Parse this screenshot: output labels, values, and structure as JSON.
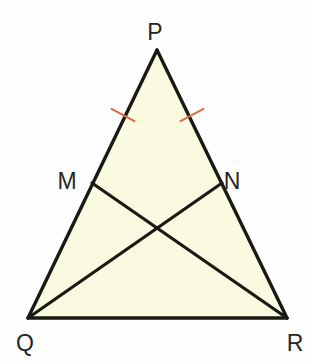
{
  "figure": {
    "canvas": {
      "width": 313,
      "height": 364,
      "background": "#fefefe"
    },
    "style": {
      "fill_color": "#FAFAE1",
      "stroke_color": "#1A1A14",
      "stroke_width": 3.2,
      "tick_color": "#DD6B45",
      "tick_width": 2.0,
      "label_color": "#262626",
      "label_font_size": 23
    },
    "points": {
      "P": {
        "label": "P",
        "x": 157,
        "y": 50,
        "label_x": 155,
        "label_y": 40
      },
      "Q": {
        "label": "Q",
        "x": 28,
        "y": 318,
        "label_x": 25,
        "label_y": 351
      },
      "R": {
        "label": "R",
        "x": 287,
        "y": 318,
        "label_x": 295,
        "label_y": 351
      },
      "M": {
        "label": "M",
        "x": 92,
        "y": 183,
        "label_x": 67,
        "label_y": 189
      },
      "N": {
        "label": "N",
        "x": 222,
        "y": 183,
        "label_x": 232,
        "label_y": 189
      },
      "X": {
        "label": "",
        "x": 158,
        "y": 231,
        "label_x": 158,
        "label_y": 231
      }
    },
    "segments": [
      {
        "name": "side-PQ",
        "from": "P",
        "to": "Q"
      },
      {
        "name": "side-PR",
        "from": "P",
        "to": "R"
      },
      {
        "name": "side-QR",
        "from": "Q",
        "to": "R"
      },
      {
        "name": "cevian-QN",
        "from": "Q",
        "to": "N"
      },
      {
        "name": "cevian-MR",
        "from": "M",
        "to": "R"
      }
    ],
    "tick_marks": [
      {
        "name": "tick-PM",
        "on_segment": "PM",
        "x": 123,
        "y": 115,
        "angle_deg": 28
      },
      {
        "name": "tick-PN",
        "on_segment": "PN",
        "x": 192,
        "y": 115,
        "angle_deg": -28
      }
    ],
    "polygon_fill_points": "157,50 287,318 28,318"
  }
}
